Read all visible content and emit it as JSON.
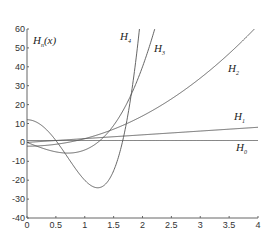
{
  "chart_data": {
    "type": "line",
    "title": "",
    "ylabel": "H_n(x)",
    "xlabel": "",
    "xlim": [
      0,
      4
    ],
    "ylim": [
      -40,
      60
    ],
    "grid": false,
    "legend": "inline labels",
    "x_ticks": [
      "0",
      "0.5",
      "1",
      "1.5",
      "2",
      "2.5",
      "3",
      "3.5",
      "4"
    ],
    "y_ticks": [
      "-40",
      "-30",
      "-20",
      "-10",
      "0",
      "10",
      "20",
      "30",
      "40",
      "50",
      "60"
    ],
    "series": [
      {
        "name": "H0",
        "label": "H",
        "sub": "0",
        "formula": "1",
        "coeffs": [
          1
        ],
        "label_pos": [
          236,
          151
        ]
      },
      {
        "name": "H1",
        "label": "H",
        "sub": "1",
        "formula": "2x",
        "coeffs": [
          0,
          2
        ],
        "label_pos": [
          234,
          120
        ]
      },
      {
        "name": "H2",
        "label": "H",
        "sub": "2",
        "formula": "4x^2-2",
        "coeffs": [
          -2,
          0,
          4
        ],
        "label_pos": [
          228,
          72
        ]
      },
      {
        "name": "H3",
        "label": "H",
        "sub": "3",
        "formula": "8x^3-12x",
        "coeffs": [
          0,
          -12,
          0,
          8
        ],
        "label_pos": [
          154,
          52
        ]
      },
      {
        "name": "H4",
        "label": "H",
        "sub": "4",
        "formula": "16x^4-48x^2+12",
        "coeffs": [
          12,
          0,
          -48,
          0,
          16
        ],
        "label_pos": [
          120,
          40
        ]
      }
    ],
    "sample_points": {
      "x": [
        0,
        0.5,
        1,
        1.5,
        2,
        2.5,
        3,
        3.5,
        4
      ],
      "H0": [
        1,
        1,
        1,
        1,
        1,
        1,
        1,
        1,
        1
      ],
      "H1": [
        0,
        1,
        2,
        3,
        4,
        5,
        6,
        7,
        8
      ],
      "H2": [
        -2,
        -1,
        2,
        7,
        14,
        23,
        34,
        47,
        62
      ],
      "H3": [
        0,
        -5,
        -4,
        9,
        40,
        95,
        180,
        301,
        464
      ],
      "H4": [
        12,
        1,
        -20,
        -15,
        76,
        361,
        876,
        1657,
        3340
      ]
    },
    "y_axis_label": {
      "main": "H",
      "sub": "n",
      "arg": "(x)"
    }
  }
}
